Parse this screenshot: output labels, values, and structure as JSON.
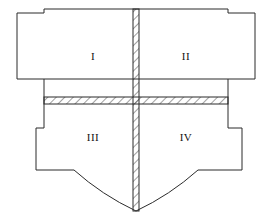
{
  "figure": {
    "kind": "engineering-section-diagram",
    "colors": {
      "background": "#ffffff",
      "outline": "#2b2b2b",
      "hatch": "#2b2b2b",
      "label": "#111111"
    },
    "stroke_width": 1,
    "quadrants": [
      {
        "id": "q1",
        "label": "I",
        "cx": 93,
        "cy": 56,
        "position": "top-left"
      },
      {
        "id": "q2",
        "label": "II",
        "cx": 186,
        "cy": 56,
        "position": "top-right"
      },
      {
        "id": "q3",
        "label": "III",
        "cx": 93,
        "cy": 137,
        "position": "bottom-left"
      },
      {
        "id": "q4",
        "label": "IV",
        "cx": 186,
        "cy": 137,
        "position": "bottom-right"
      }
    ],
    "outline_path": "M 17 13 L 44 13 L 44 9 L 228 9 L 228 13 L 255 13 L 255 79 L 228 79 L 228 128 L 242 128 L 242 170 L 198 170 Q 139 212 139 212 Q 139 212 80 170 L 36 170 L 36 128 L 44 128 L 44 79 L 17 79 Z",
    "interior_lines": [
      {
        "name": "upper-horizontal-divider",
        "x1": 44,
        "y1": 79,
        "x2": 228,
        "y2": 79
      }
    ],
    "vertical_web": {
      "x": 133,
      "y": 9,
      "width": 6,
      "height": 203
    },
    "horizontal_rib": {
      "x": 44,
      "y": 97,
      "width": 184,
      "height": 7
    },
    "hatch_spacing": 6,
    "hatch_angle_deg": 45
  }
}
